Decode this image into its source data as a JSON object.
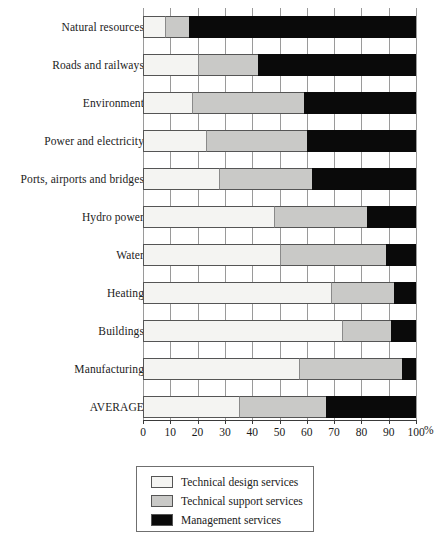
{
  "chart_data": {
    "type": "bar",
    "orientation": "horizontal",
    "stacked": true,
    "stack_total": 100,
    "title": "",
    "xlabel": "%",
    "ylabel": "",
    "xlim": [
      0,
      100
    ],
    "grid": true,
    "legend_position": "bottom",
    "tick_labels": [
      "0",
      "10",
      "20",
      "30",
      "40",
      "50",
      "60",
      "70",
      "80",
      "90",
      "100"
    ],
    "ticks": [
      0,
      10,
      20,
      30,
      40,
      50,
      60,
      70,
      80,
      90,
      100
    ],
    "unit": "%",
    "categories": [
      "Natural resources",
      "Roads and railways",
      "Environment",
      "Power and electricity",
      "Ports, airports and bridges",
      "Hydro power",
      "Water",
      "Heating",
      "Buildings",
      "Manufacturing",
      "AVERAGE"
    ],
    "series": [
      {
        "name": "Technical design services",
        "color": "#f4f4f2",
        "values": [
          8,
          20,
          18,
          23,
          28,
          48,
          50,
          69,
          73,
          57,
          35
        ]
      },
      {
        "name": "Technical support services",
        "color": "#c9c9c7",
        "values": [
          9,
          22,
          41,
          37,
          34,
          34,
          39,
          23,
          18,
          38,
          32
        ]
      },
      {
        "name": "Management services",
        "color": "#0a0a0a",
        "values": [
          83,
          58,
          41,
          40,
          38,
          18,
          11,
          8,
          9,
          5,
          33
        ]
      }
    ],
    "cumulative_boundaries": [
      [
        8,
        17
      ],
      [
        20,
        42
      ],
      [
        18,
        59
      ],
      [
        23,
        60
      ],
      [
        28,
        62
      ],
      [
        48,
        82
      ],
      [
        50,
        89
      ],
      [
        69,
        92
      ],
      [
        73,
        91
      ],
      [
        57,
        95
      ],
      [
        35,
        67
      ]
    ]
  },
  "legend": {
    "items": [
      {
        "label": "Technical design services",
        "color": "#f4f4f2"
      },
      {
        "label": "Technical support services",
        "color": "#c9c9c7"
      },
      {
        "label": "Management services",
        "color": "#0a0a0a"
      }
    ]
  }
}
